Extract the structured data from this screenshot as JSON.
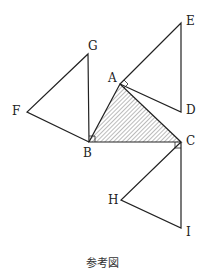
{
  "diagram": {
    "caption": "参考図",
    "labels": {
      "A": "A",
      "B": "B",
      "C": "C",
      "D": "D",
      "E": "E",
      "F": "F",
      "G": "G",
      "H": "H",
      "I": "I"
    },
    "points": {
      "A": [
        120,
        84
      ],
      "B": [
        89,
        142
      ],
      "C": [
        181,
        142
      ],
      "D": [
        181,
        112
      ],
      "E": [
        181,
        23
      ],
      "F": [
        27,
        112
      ],
      "G": [
        88,
        54
      ],
      "H": [
        121,
        200
      ],
      "I": [
        181,
        228
      ]
    },
    "shaded_triangle": [
      "A",
      "B",
      "C"
    ],
    "triangles": [
      [
        "A",
        "E",
        "D"
      ],
      [
        "B",
        "G",
        "F"
      ],
      [
        "C",
        "H",
        "I"
      ]
    ],
    "right_angles": [
      "A",
      "B",
      "C"
    ],
    "colors": {
      "stroke": "#222222",
      "hatch": "#555555"
    }
  }
}
